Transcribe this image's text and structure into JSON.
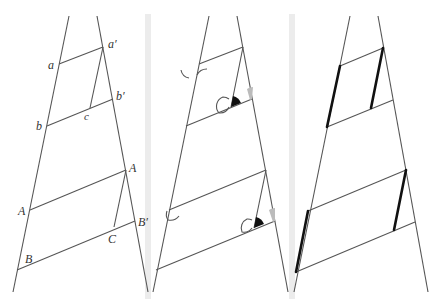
{
  "figure": {
    "panels": [
      {
        "id": "labeled",
        "labels": {
          "a": "a",
          "a_prime": "a′",
          "b": "b",
          "b_prime": "b′",
          "c": "c",
          "A_left": "A",
          "A_right": "A",
          "B": "B",
          "B_prime": "B′",
          "C": "C"
        }
      },
      {
        "id": "angles",
        "description": "Corresponding angles marked with arcs, black and grey wedges"
      },
      {
        "id": "highlighted",
        "description": "Equal sides emphasized with bold strokes"
      }
    ],
    "colors": {
      "line": "#555555",
      "bold": "#111111",
      "separator": "#e4e4e4",
      "wedge_black": "#111111",
      "wedge_grey": "#bbbbbb"
    }
  }
}
